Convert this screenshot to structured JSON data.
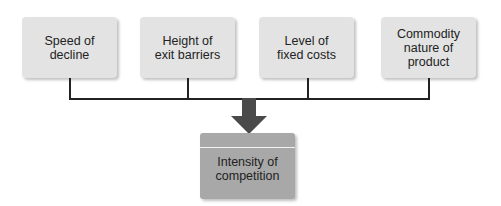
{
  "diagram": {
    "inputs": [
      {
        "label_line1": "Speed of",
        "label_line2": "decline",
        "label_line3": ""
      },
      {
        "label_line1": "Height of",
        "label_line2": "exit barriers",
        "label_line3": ""
      },
      {
        "label_line1": "Level of",
        "label_line2": "fixed costs",
        "label_line3": ""
      },
      {
        "label_line1": "Commodity",
        "label_line2": "nature of",
        "label_line3": "product"
      }
    ],
    "output": {
      "label_line1": "Intensity of",
      "label_line2": "competition"
    },
    "colors": {
      "input_box": "#e3e3e3",
      "output_box": "#a8a8a8",
      "arrow": "#4a4a4a",
      "connector": "#222222"
    }
  }
}
